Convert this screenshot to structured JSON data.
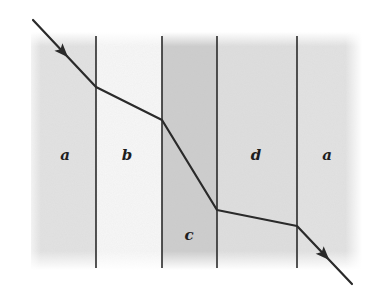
{
  "figure": {
    "canvas": {
      "width": 384,
      "height": 303
    },
    "panel": {
      "x0": 31,
      "x1": 362,
      "y0": 32,
      "y1": 270
    },
    "regions": [
      {
        "label": "a",
        "x0": 31,
        "x1": 96,
        "fill": "#e2e2e2",
        "label_x": 65,
        "label_y": 160
      },
      {
        "label": "b",
        "x0": 96,
        "x1": 162,
        "fill": "#f7f7f7",
        "label_x": 127,
        "label_y": 160
      },
      {
        "label": "c",
        "x0": 162,
        "x1": 217,
        "fill": "#cdcdcd",
        "label_x": 189,
        "label_y": 240
      },
      {
        "label": "d",
        "x0": 217,
        "x1": 297,
        "fill": "#dedede",
        "label_x": 256,
        "label_y": 160
      },
      {
        "label": "a",
        "x0": 297,
        "x1": 362,
        "fill": "#e2e2e2",
        "label_x": 327,
        "label_y": 160
      }
    ],
    "boundaries": [
      96,
      162,
      217,
      297
    ],
    "ray": {
      "points": [
        [
          33,
          20
        ],
        [
          96,
          87
        ],
        [
          162,
          120
        ],
        [
          217,
          210
        ],
        [
          297,
          226
        ],
        [
          352,
          284
        ]
      ],
      "arrows": [
        {
          "segment": 0,
          "t": 0.48
        },
        {
          "segment": 4,
          "t": 0.5
        }
      ],
      "color": "#2a2a2a"
    },
    "colors": {
      "boundary_line": "#2a2a2a",
      "background": "#ffffff"
    }
  }
}
